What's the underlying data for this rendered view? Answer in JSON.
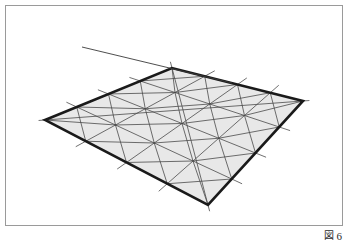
{
  "document": {
    "kind": "technical-figure",
    "background_color": "#ffffff"
  },
  "frame": {
    "border_color": "#9a9a9a",
    "border_width_px": 1
  },
  "caption": {
    "label": "図",
    "number": "6",
    "full_text": "図 6",
    "color": "#2b2b2b"
  },
  "figure": {
    "title": "",
    "fill_color": "#e8e8e8",
    "outline_color": "#1a1a1a",
    "outline_width_px": 2.6,
    "grid_line_color": "#4a4a4a",
    "grid_line_width_px": 0.8,
    "ray_line_color": "#3a3a3a",
    "ray_line_width_px": 0.9,
    "divisions": 4,
    "corners": {
      "top": [
        172,
        68
      ],
      "right": [
        303,
        101
      ],
      "bottom": [
        208,
        205
      ],
      "left": [
        45,
        120
      ]
    },
    "overshoot_px": 11,
    "ray": {
      "start": [
        82,
        47
      ],
      "end": [
        232,
        83
      ]
    }
  },
  "chart_data": {
    "type": "diagram",
    "title": "",
    "xlabel": "",
    "ylabel": "",
    "nodes": [
      {
        "name": "corner-top",
        "x": 172,
        "y": 68
      },
      {
        "name": "corner-right",
        "x": 303,
        "y": 101
      },
      {
        "name": "corner-bottom",
        "x": 208,
        "y": 205
      },
      {
        "name": "corner-left",
        "x": 45,
        "y": 120
      }
    ],
    "mesh": {
      "rows": 4,
      "cols": 4,
      "cell_shape": "quad-with-both-diagonals",
      "triangles": 32
    }
  }
}
